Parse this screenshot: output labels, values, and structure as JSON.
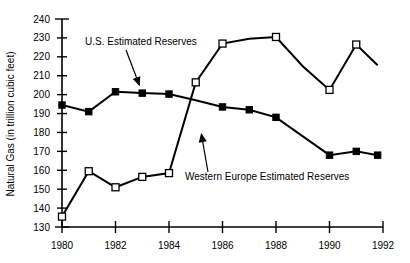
{
  "chart_data": {
    "type": "line",
    "title": "",
    "subtitle": "",
    "xlabel": "",
    "ylabel": "Natural Gas (in trillion cubic feet)",
    "xlim": [
      1980,
      1992
    ],
    "ylim": [
      130,
      240
    ],
    "grid": false,
    "legend_position": "inline-annotations",
    "x_ticks": [
      "1980",
      "1982",
      "1984",
      "1986",
      "1988",
      "1990",
      "1992"
    ],
    "x_tick_values": [
      1980,
      1982,
      1984,
      1986,
      1988,
      1990,
      1992
    ],
    "y_ticks": [
      "130",
      "140",
      "150",
      "160",
      "170",
      "180",
      "190",
      "200",
      "210",
      "220",
      "230",
      "240"
    ],
    "y_tick_values": [
      130,
      140,
      150,
      160,
      170,
      180,
      190,
      200,
      210,
      220,
      230,
      240
    ],
    "x": [
      1980,
      1981,
      1982,
      1983,
      1984,
      1985,
      1986,
      1987,
      1988,
      1989,
      1990,
      1991,
      1991.8
    ],
    "series": [
      {
        "name": "U.S. Estimated Reserves",
        "marker": "filled-square",
        "x": [
          1980,
          1981,
          1982,
          1983,
          1984,
          1985,
          1986,
          1987,
          1988,
          1990,
          1991,
          1991.8
        ],
        "values": [
          194.5,
          191.0,
          201.5,
          200.8,
          200.3,
          197.0,
          193.5,
          192.0,
          188.0,
          168.0,
          170.0,
          168.0
        ],
        "marker_x": [
          1980,
          1981,
          1982,
          1983,
          1984,
          1986,
          1987,
          1988,
          1990,
          1991,
          1991.8
        ],
        "marker_values": [
          194.5,
          191.0,
          201.5,
          200.8,
          200.3,
          193.5,
          192.0,
          188.0,
          168.0,
          170.0,
          168.0
        ]
      },
      {
        "name": "Western Europe Estimated Reserves",
        "marker": "open-square",
        "x": [
          1980,
          1981,
          1982,
          1983,
          1984,
          1985,
          1986,
          1987,
          1988,
          1989,
          1990,
          1991,
          1991.8
        ],
        "values": [
          135.5,
          159.5,
          151.0,
          156.5,
          158.5,
          206.5,
          227.0,
          229.5,
          230.5,
          215.0,
          202.5,
          226.5,
          215.5
        ],
        "marker_x": [
          1980,
          1981,
          1982,
          1983,
          1984,
          1985,
          1986,
          1988,
          1990,
          1991
        ],
        "marker_values": [
          135.5,
          159.5,
          151.0,
          156.5,
          158.5,
          206.5,
          227.0,
          230.5,
          202.5,
          226.5
        ]
      }
    ],
    "annotations": [
      {
        "text": "U.S. Estimated Reserves",
        "target_x": 1983.0,
        "target_y": 201.0
      },
      {
        "text": "Western Europe Estimated Reserves",
        "target_x": 1985.1,
        "target_y": 180.0
      }
    ]
  }
}
